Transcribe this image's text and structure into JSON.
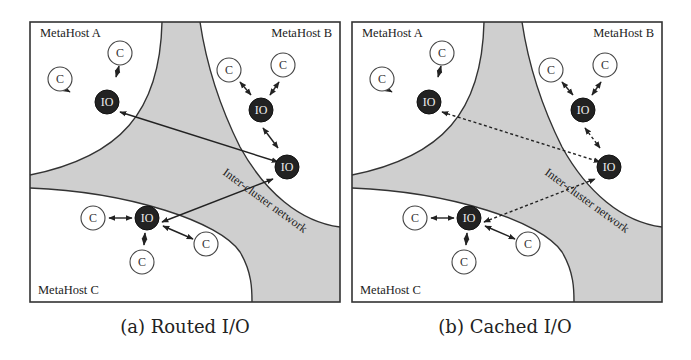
{
  "figure": {
    "panels": [
      {
        "id": "a",
        "caption": "(a) Routed I/O",
        "link_style": "solid",
        "hosts": {
          "A": "MetaHost A",
          "B": "MetaHost B",
          "C": "MetaHost C"
        },
        "network_label": "Inter-cluster network",
        "client_label": "C",
        "io_label": "IO"
      },
      {
        "id": "b",
        "caption": "(b) Cached I/O",
        "link_style": "dotted",
        "hosts": {
          "A": "MetaHost A",
          "B": "MetaHost B",
          "C": "MetaHost C"
        },
        "network_label": "Inter-cluster network",
        "client_label": "C",
        "io_label": "IO"
      }
    ]
  }
}
